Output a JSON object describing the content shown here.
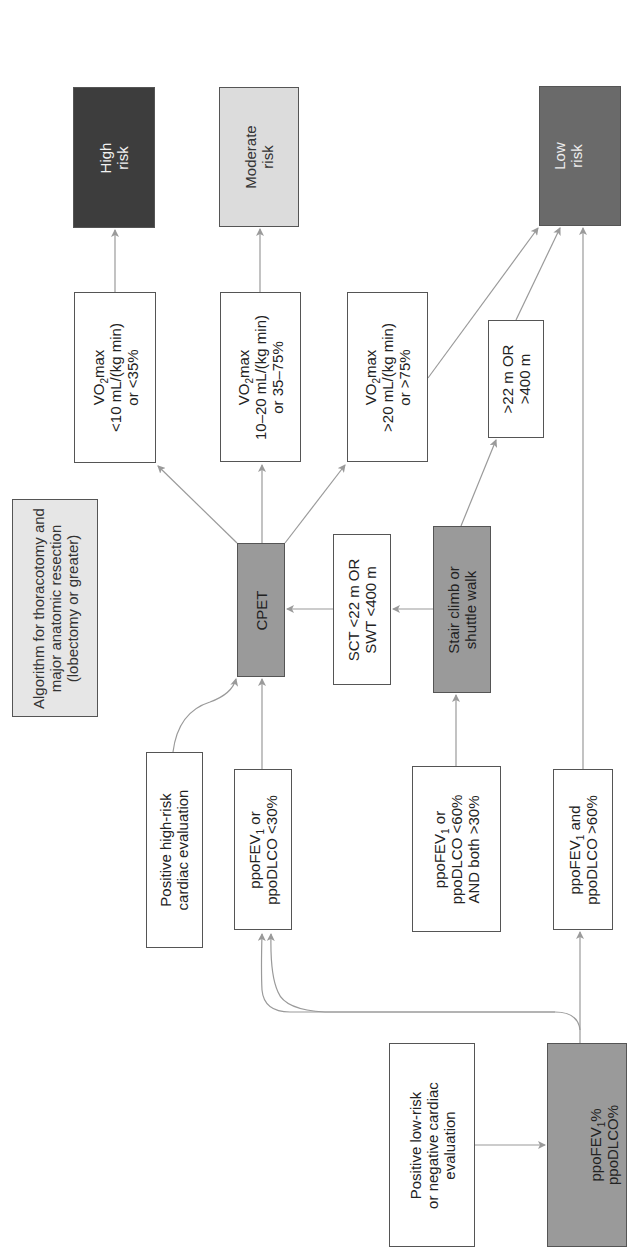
{
  "diagram": {
    "orientation": "rotated-90-ccw",
    "title": {
      "lines": [
        "Algorithm for thoracotomy and",
        "major anatomic resection",
        "(lobectomy or greater)"
      ]
    },
    "nodes": {
      "start": {
        "lines": [
          "ppoFEV1%",
          "ppoDLCO%"
        ]
      },
      "low_risk_cardiac": {
        "lines": [
          "Positive low-risk",
          "or negative cardiac",
          "evaluation"
        ]
      },
      "high_risk_cardiac": {
        "lines": [
          "Positive high-risk",
          "cardiac evaluation"
        ]
      },
      "ppo_lt30": {
        "lines": [
          "ppoFEV1 or",
          "ppoDLCO <30%"
        ]
      },
      "ppo_30_60": {
        "lines": [
          "ppoFEV1 or",
          "ppoDLCO <60%",
          "AND both >30%"
        ]
      },
      "ppo_gt60": {
        "lines": [
          "ppoFEV1 and",
          "ppoDLCO >60%"
        ]
      },
      "stair_climb": {
        "lines": [
          "Stair climb or",
          "shuttle walk"
        ]
      },
      "sct_fail": {
        "lines": [
          "SCT <22 m OR",
          "SWT <400 m"
        ]
      },
      "sct_pass": {
        "lines": [
          ">22 m OR",
          ">400 m"
        ]
      },
      "cpet": {
        "lines": [
          "CPET"
        ]
      },
      "vo2_low": {
        "lines": [
          "VO2max",
          "<10 mL/(kg min)",
          "or <35%"
        ]
      },
      "vo2_mid": {
        "lines": [
          "VO2max",
          "10–20 mL/(kg min)",
          "or 35–75%"
        ]
      },
      "vo2_high": {
        "lines": [
          "VO2max",
          ">20 mL/(kg min)",
          "or >75%"
        ]
      },
      "high_risk": {
        "lines": [
          "High",
          "risk"
        ]
      },
      "moderate_risk": {
        "lines": [
          "Moderate",
          "risk"
        ]
      },
      "low_risk": {
        "lines": [
          "Low",
          "risk"
        ]
      }
    },
    "colors": {
      "high_risk_fill": "#3d3d3d",
      "moderate_risk_fill": "#dcdcdc",
      "low_risk_fill": "#6a6a6a",
      "process_fill": "#9a9a9a",
      "title_fill": "#e6e6e6",
      "arrow": "#9a9a9a",
      "border": "#555555"
    }
  }
}
